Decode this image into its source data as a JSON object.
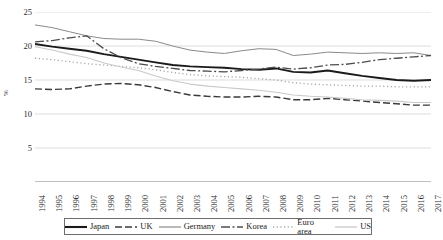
{
  "chart_data": {
    "type": "line",
    "title": "",
    "xlabel": "",
    "ylabel": "%",
    "ylim": [
      0,
      25
    ],
    "yticks": [
      0,
      5,
      10,
      15,
      20,
      25
    ],
    "ytick_labels": [
      "",
      "5",
      "10",
      "15",
      "20",
      "25"
    ],
    "grid": true,
    "grid_axis": "y",
    "legend_position": "bottom",
    "x": [
      1994,
      1995,
      1996,
      1997,
      1998,
      1999,
      2000,
      2001,
      2002,
      2003,
      2004,
      2005,
      2006,
      2007,
      2008,
      2009,
      2010,
      2011,
      2012,
      2013,
      2014,
      2015,
      2016,
      2017
    ],
    "categories": [
      "1994",
      "1995",
      "1996",
      "1997",
      "1998",
      "1999",
      "2000",
      "2001",
      "2002",
      "2003",
      "2004",
      "2005",
      "2006",
      "2007",
      "2008",
      "2009",
      "2010",
      "2011",
      "2012",
      "2013",
      "2014",
      "2015",
      "2016",
      "2017"
    ],
    "series": [
      {
        "name": "Japan",
        "style": "solid-thick",
        "color": "#1a1a1a",
        "width": 1.9,
        "dash": "",
        "values": [
          20.3,
          19.9,
          19.6,
          19.3,
          18.8,
          18.4,
          18.0,
          17.6,
          17.2,
          17.0,
          16.9,
          16.8,
          16.6,
          16.5,
          16.7,
          16.2,
          16.1,
          16.4,
          16.0,
          15.6,
          15.3,
          15.0,
          14.9,
          15.0
        ]
      },
      {
        "name": "UK",
        "style": "dashed",
        "color": "#3a3a3a",
        "width": 1.4,
        "dash": "7,3",
        "values": [
          13.7,
          13.6,
          13.7,
          14.1,
          14.4,
          14.5,
          14.3,
          13.9,
          13.3,
          12.8,
          12.6,
          12.5,
          12.5,
          12.6,
          12.5,
          12.1,
          12.1,
          12.3,
          12.1,
          11.9,
          11.7,
          11.5,
          11.3,
          11.3
        ]
      },
      {
        "name": "Germany",
        "style": "solid-thin",
        "color": "#8a8a8a",
        "width": 1.0,
        "dash": "",
        "values": [
          23.1,
          22.7,
          22.1,
          21.5,
          21.1,
          21.0,
          21.0,
          20.7,
          20.0,
          19.4,
          19.1,
          18.9,
          19.3,
          19.6,
          19.5,
          18.6,
          18.8,
          19.1,
          19.0,
          18.9,
          19.0,
          18.9,
          19.0,
          18.6
        ]
      },
      {
        "name": "Korea",
        "style": "dash-dot",
        "color": "#4d4d4d",
        "width": 1.3,
        "dash": "9,2.5,2,2.5",
        "values": [
          20.6,
          20.8,
          21.2,
          21.5,
          19.6,
          18.3,
          17.4,
          17.0,
          16.7,
          16.4,
          16.3,
          16.2,
          16.4,
          16.6,
          16.9,
          16.6,
          16.8,
          17.2,
          17.3,
          17.6,
          18.0,
          18.2,
          18.4,
          18.6
        ]
      },
      {
        "name": "Euro area",
        "style": "dotted",
        "color": "#a5a5a5",
        "width": 1.3,
        "dash": "1.2,2.6",
        "values": [
          18.2,
          18.0,
          17.7,
          17.4,
          17.2,
          17.0,
          16.8,
          16.5,
          16.1,
          15.8,
          15.6,
          15.5,
          15.4,
          15.2,
          15.0,
          14.6,
          14.4,
          14.3,
          14.2,
          14.1,
          14.1,
          14.0,
          14.0,
          14.0
        ]
      },
      {
        "name": "US",
        "style": "solid-light",
        "color": "#c9c9c9",
        "width": 1.1,
        "dash": "",
        "values": [
          19.9,
          19.4,
          18.8,
          18.3,
          17.5,
          16.9,
          16.4,
          15.6,
          14.9,
          14.4,
          14.1,
          13.9,
          13.7,
          13.5,
          13.2,
          12.8,
          12.6,
          12.5,
          12.3,
          12.1,
          12.0,
          11.9,
          11.7,
          11.7
        ]
      }
    ]
  }
}
